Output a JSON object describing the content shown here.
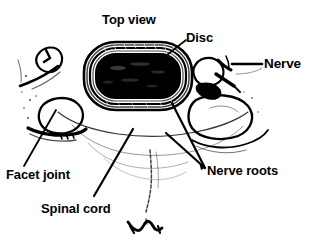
{
  "figure": {
    "title": "Top view",
    "kind": "anatomical-line-drawing",
    "view": "axial / transverse cross-section of vertebra with intervertebral disc",
    "background_color": "#ffffff",
    "ink_color": "#000000",
    "width": 316,
    "height": 249
  },
  "labels": {
    "top_view": "Top view",
    "disc": "Disc",
    "nerve": "Nerve",
    "nerve_roots": "Nerve roots",
    "facet_joint": "Facet joint",
    "spinal_cord": "Spinal cord"
  },
  "structures": [
    {
      "name": "disc",
      "label": "Disc",
      "description": "Large dark oval (rounded rectangle) at top center with concentric annulus rings and solid black nucleus"
    },
    {
      "name": "nerve",
      "label": "Nerve",
      "description": "Small branching nerve structure on the right side of the vertebral body"
    },
    {
      "name": "nerve-roots",
      "label": "Nerve roots",
      "description": "Paired roots emerging at the posterolateral margins, indicated by two converging leader lines"
    },
    {
      "name": "facet-joint",
      "label": "Facet joint",
      "description": "Articular process on the left lateral side of the vertebra"
    },
    {
      "name": "spinal-cord",
      "label": "Spinal cord",
      "description": "Central canal region posterior to the vertebral body"
    }
  ],
  "leader_lines": [
    {
      "name": "disc-leader",
      "from": [
        186,
        40
      ],
      "to": [
        163,
        58
      ]
    },
    {
      "name": "nerve-leader",
      "from": [
        262,
        64
      ],
      "to": [
        232,
        64
      ]
    },
    {
      "name": "nerve-roots-leader-upper",
      "from": [
        205,
        168
      ],
      "to": [
        172,
        103
      ]
    },
    {
      "name": "nerve-roots-leader-lower",
      "from": [
        205,
        168
      ],
      "to": [
        166,
        133
      ]
    },
    {
      "name": "facet-joint-leader",
      "from": [
        24,
        166
      ],
      "to": [
        56,
        110
      ]
    },
    {
      "name": "spinal-cord-leader",
      "from": [
        94,
        196
      ],
      "to": [
        133,
        129
      ]
    }
  ]
}
